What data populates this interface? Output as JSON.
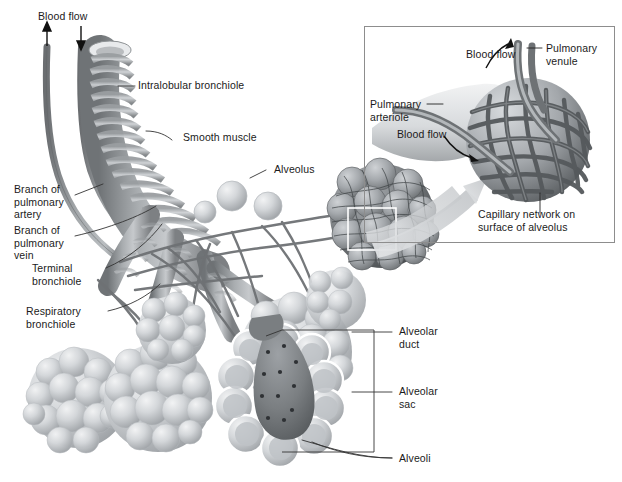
{
  "figure": {
    "width": 622,
    "height": 482,
    "style": "grayscale medical illustration",
    "background_color": "#ffffff",
    "text_color": "#1b1b1b",
    "leader_line_color": "#333333",
    "vessel_color": "#8a8d90",
    "alveoli_color": "#c9ccd0",
    "capillary_color": "#6e7174"
  },
  "main_labels": {
    "blood_flow": "Blood flow",
    "intralobular_bronchiole": "Intralobular bronchiole",
    "smooth_muscle": "Smooth muscle",
    "alveolus": "Alveolus",
    "branch_pulmonary_artery": "Branch of\npulmonary\nartery",
    "branch_pulmonary_vein": "Branch of\npulmonary\nvein",
    "terminal_bronchiole": "Terminal\nbronchiole",
    "respiratory_bronchiole": "Respiratory\nbronchiole",
    "alveolar_duct": "Alveolar\nduct",
    "alveolar_sac": "Alveolar\nsac",
    "alveoli": "Alveoli"
  },
  "inset": {
    "caption": "Capillary network on\nsurface of alveolus",
    "pulmonary_venule": "Pulmonary\nvenule",
    "pulmonary_arteriole": "Pulmonary\narteriole",
    "blood_flow_in": "Blood flow",
    "blood_flow_out": "Blood flow",
    "border_color": "#8d8d8d"
  },
  "arrows": {
    "blood_flow_up": "up-arrow",
    "blood_flow_down": "down-arrow",
    "inset_pointer": "tapered-magnify-arrow"
  }
}
